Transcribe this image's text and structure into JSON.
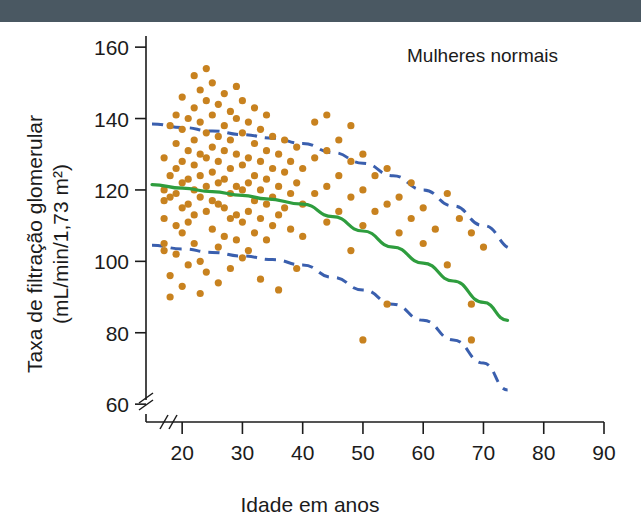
{
  "figure": {
    "top_bar_color": "#4a5862",
    "background_color": "#ffffff"
  },
  "chart_data": {
    "type": "scatter",
    "title": "Mulheres normais",
    "xlabel": "Idade em anos",
    "ylabel": "Taxa de filtração glomerular\n(mL/min/1,73 m²)",
    "ylabel_line1": "Taxa de filtração glomerular",
    "ylabel_line2": "(mL/min/1,73 m²)",
    "xlim": [
      14,
      90
    ],
    "ylim": [
      55,
      162
    ],
    "xticks": [
      20,
      30,
      40,
      50,
      60,
      70,
      80,
      90
    ],
    "yticks": [
      60,
      80,
      100,
      120,
      140,
      160
    ],
    "xtick_labels": [
      "20",
      "30",
      "40",
      "50",
      "60",
      "70",
      "80",
      "90"
    ],
    "ytick_labels": [
      "60",
      "80",
      "100",
      "120",
      "140",
      "160"
    ],
    "grid": false,
    "axis_break_x": true,
    "axis_break_y": true,
    "legend_position": "none",
    "colors": {
      "points": "#c8821f",
      "mean_line": "#2e9d3e",
      "confidence_band": "#3a5fae",
      "axis": "#1b1b1b"
    },
    "series": [
      {
        "name": "Mulheres normais (pontos individuais)",
        "type": "scatter",
        "marker": "circle",
        "color": "#c8821f",
        "points": [
          [
            17,
            129
          ],
          [
            17,
            120
          ],
          [
            17,
            117
          ],
          [
            17,
            112
          ],
          [
            17,
            105
          ],
          [
            17,
            103
          ],
          [
            18,
            138
          ],
          [
            18,
            124
          ],
          [
            18,
            118
          ],
          [
            18,
            96
          ],
          [
            18,
            90
          ],
          [
            19,
            141
          ],
          [
            19,
            133
          ],
          [
            19,
            126
          ],
          [
            19,
            119
          ],
          [
            19,
            110
          ],
          [
            19,
            102
          ],
          [
            20,
            146
          ],
          [
            20,
            137
          ],
          [
            20,
            128
          ],
          [
            20,
            122
          ],
          [
            20,
            115
          ],
          [
            20,
            108
          ],
          [
            20,
            93
          ],
          [
            21,
            140
          ],
          [
            21,
            131
          ],
          [
            21,
            123
          ],
          [
            21,
            116
          ],
          [
            21,
            111
          ],
          [
            21,
            99
          ],
          [
            22,
            152
          ],
          [
            22,
            143
          ],
          [
            22,
            134
          ],
          [
            22,
            127
          ],
          [
            22,
            120
          ],
          [
            22,
            113
          ],
          [
            22,
            105
          ],
          [
            23,
            148
          ],
          [
            23,
            139
          ],
          [
            23,
            130
          ],
          [
            23,
            124
          ],
          [
            23,
            118
          ],
          [
            23,
            100
          ],
          [
            23,
            91
          ],
          [
            24,
            154
          ],
          [
            24,
            145
          ],
          [
            24,
            136
          ],
          [
            24,
            129
          ],
          [
            24,
            121
          ],
          [
            24,
            114
          ],
          [
            24,
            97
          ],
          [
            25,
            150
          ],
          [
            25,
            141
          ],
          [
            25,
            132
          ],
          [
            25,
            125
          ],
          [
            25,
            117
          ],
          [
            25,
            109
          ],
          [
            26,
            144
          ],
          [
            26,
            135
          ],
          [
            26,
            128
          ],
          [
            26,
            122
          ],
          [
            26,
            116
          ],
          [
            26,
            104
          ],
          [
            26,
            94
          ],
          [
            27,
            147
          ],
          [
            27,
            138
          ],
          [
            27,
            131
          ],
          [
            27,
            123
          ],
          [
            27,
            115
          ],
          [
            27,
            107
          ],
          [
            28,
            142
          ],
          [
            28,
            134
          ],
          [
            28,
            126
          ],
          [
            28,
            119
          ],
          [
            28,
            112
          ],
          [
            28,
            98
          ],
          [
            29,
            149
          ],
          [
            29,
            140
          ],
          [
            29,
            130
          ],
          [
            29,
            121
          ],
          [
            29,
            113
          ],
          [
            29,
            106
          ],
          [
            30,
            145
          ],
          [
            30,
            136
          ],
          [
            30,
            127
          ],
          [
            30,
            120
          ],
          [
            30,
            111
          ],
          [
            30,
            101
          ],
          [
            31,
            139
          ],
          [
            31,
            129
          ],
          [
            31,
            122
          ],
          [
            31,
            114
          ],
          [
            31,
            103
          ],
          [
            32,
            143
          ],
          [
            32,
            133
          ],
          [
            32,
            124
          ],
          [
            32,
            117
          ],
          [
            32,
            108
          ],
          [
            33,
            137
          ],
          [
            33,
            128
          ],
          [
            33,
            120
          ],
          [
            33,
            112
          ],
          [
            33,
            95
          ],
          [
            34,
            141
          ],
          [
            34,
            131
          ],
          [
            34,
            123
          ],
          [
            34,
            116
          ],
          [
            34,
            106
          ],
          [
            35,
            135
          ],
          [
            35,
            126
          ],
          [
            35,
            118
          ],
          [
            35,
            110
          ],
          [
            36,
            130
          ],
          [
            36,
            121
          ],
          [
            36,
            113
          ],
          [
            36,
            92
          ],
          [
            37,
            134
          ],
          [
            37,
            125
          ],
          [
            37,
            115
          ],
          [
            38,
            128
          ],
          [
            38,
            119
          ],
          [
            38,
            109
          ],
          [
            39,
            132
          ],
          [
            39,
            122
          ],
          [
            39,
            98
          ],
          [
            40,
            126
          ],
          [
            40,
            116
          ],
          [
            40,
            107
          ],
          [
            42,
            139
          ],
          [
            42,
            129
          ],
          [
            42,
            119
          ],
          [
            44,
            141
          ],
          [
            44,
            131
          ],
          [
            44,
            121
          ],
          [
            44,
            111
          ],
          [
            46,
            134
          ],
          [
            46,
            124
          ],
          [
            46,
            114
          ],
          [
            48,
            138
          ],
          [
            48,
            128
          ],
          [
            48,
            118
          ],
          [
            48,
            103
          ],
          [
            50,
            130
          ],
          [
            50,
            120
          ],
          [
            50,
            110
          ],
          [
            50,
            78
          ],
          [
            52,
            124
          ],
          [
            52,
            114
          ],
          [
            54,
            126
          ],
          [
            54,
            116
          ],
          [
            54,
            88
          ],
          [
            56,
            118
          ],
          [
            56,
            108
          ],
          [
            58,
            122
          ],
          [
            58,
            112
          ],
          [
            60,
            115
          ],
          [
            60,
            105
          ],
          [
            62,
            109
          ],
          [
            64,
            119
          ],
          [
            64,
            99
          ],
          [
            66,
            112
          ],
          [
            68,
            108
          ],
          [
            68,
            88
          ],
          [
            68,
            78
          ],
          [
            70,
            104
          ]
        ]
      },
      {
        "name": "Média (linha verde)",
        "type": "line",
        "style": "solid",
        "color": "#2e9d3e",
        "points": [
          [
            15,
            121.5
          ],
          [
            20,
            120.5
          ],
          [
            25,
            119.5
          ],
          [
            30,
            118.5
          ],
          [
            34,
            117.5
          ],
          [
            40,
            116.0
          ],
          [
            45,
            112.5
          ],
          [
            50,
            108.5
          ],
          [
            55,
            104.0
          ],
          [
            60,
            99.5
          ],
          [
            65,
            94.5
          ],
          [
            70,
            88.5
          ],
          [
            74,
            83.5
          ]
        ]
      },
      {
        "name": "Limite superior (95%, tracejado azul)",
        "type": "line",
        "style": "dashed",
        "color": "#3a5fae",
        "points": [
          [
            15,
            138.5
          ],
          [
            20,
            137.5
          ],
          [
            25,
            136.5
          ],
          [
            30,
            135.5
          ],
          [
            35,
            134.5
          ],
          [
            40,
            133.0
          ],
          [
            45,
            130.5
          ],
          [
            50,
            127.5
          ],
          [
            55,
            124.0
          ],
          [
            60,
            120.0
          ],
          [
            65,
            115.5
          ],
          [
            70,
            110.0
          ],
          [
            75,
            103.5
          ]
        ]
      },
      {
        "name": "Limite inferior (95%, tracejado azul)",
        "type": "line",
        "style": "dashed",
        "color": "#3a5fae",
        "points": [
          [
            15,
            104.5
          ],
          [
            20,
            103.5
          ],
          [
            25,
            102.5
          ],
          [
            30,
            101.5
          ],
          [
            35,
            100.5
          ],
          [
            40,
            99.0
          ],
          [
            45,
            95.5
          ],
          [
            50,
            92.0
          ],
          [
            55,
            88.0
          ],
          [
            60,
            83.5
          ],
          [
            65,
            78.0
          ],
          [
            70,
            71.5
          ],
          [
            74,
            64.0
          ]
        ]
      }
    ]
  }
}
